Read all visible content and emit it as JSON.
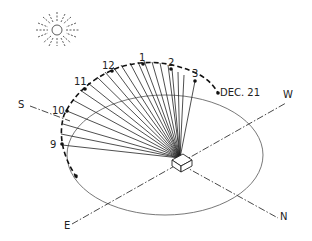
{
  "diagram": {
    "type": "sun-path-isometric",
    "colors": {
      "ink": "#222222",
      "background": "#ffffff"
    },
    "compass": {
      "south": "S",
      "west": "W",
      "east": "E",
      "north": "N"
    },
    "arc_label": "DEC. 21",
    "hours": [
      {
        "label": "9",
        "x": 47,
        "y": 144
      },
      {
        "label": "10",
        "x": 41,
        "y": 112
      },
      {
        "label": "11",
        "x": 78,
        "y": 86
      },
      {
        "label": "12",
        "x": 108,
        "y": 69
      },
      {
        "label": "1",
        "x": 143,
        "y": 61
      },
      {
        "label": "2",
        "x": 173,
        "y": 66
      },
      {
        "label": "3",
        "x": 195,
        "y": 76
      }
    ],
    "sun_icon": "sun-icon"
  }
}
